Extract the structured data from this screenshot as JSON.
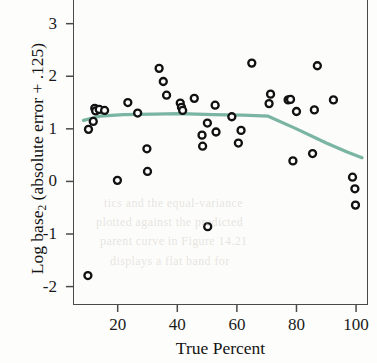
{
  "chart_data": {
    "type": "scatter",
    "title": "",
    "xlabel": "True Percent",
    "ylabel": "Log base_2 (absolute error + .125)",
    "ylabel_main": "Log base",
    "ylabel_sub": "2",
    "ylabel_tail": " (absolute error + .125)",
    "xlim": [
      5,
      104
    ],
    "ylim": [
      -2.35,
      3.45
    ],
    "xticks": [
      20,
      40,
      60,
      80,
      100
    ],
    "yticks": [
      3,
      2,
      1,
      0,
      -1,
      -2
    ],
    "xtick_labels": [
      "20",
      "40",
      "60",
      "80",
      "100"
    ],
    "ytick_labels": [
      "3",
      "2",
      "1",
      "0",
      "-1",
      "-2"
    ],
    "grid": false,
    "legend": false,
    "marker": "open-circle",
    "marker_color": "#111111",
    "marker_face": "#ffffff",
    "points": [
      {
        "x": 10.0,
        "y": -1.79
      },
      {
        "x": 10.2,
        "y": 0.99
      },
      {
        "x": 11.8,
        "y": 1.14
      },
      {
        "x": 12.3,
        "y": 1.39
      },
      {
        "x": 12.6,
        "y": 1.34
      },
      {
        "x": 13.8,
        "y": 1.37
      },
      {
        "x": 15.6,
        "y": 1.35
      },
      {
        "x": 19.9,
        "y": 0.02
      },
      {
        "x": 23.4,
        "y": 1.5
      },
      {
        "x": 26.7,
        "y": 1.3
      },
      {
        "x": 29.8,
        "y": 0.62
      },
      {
        "x": 30.0,
        "y": 0.19
      },
      {
        "x": 33.9,
        "y": 2.15
      },
      {
        "x": 35.3,
        "y": 1.9
      },
      {
        "x": 36.4,
        "y": 1.64
      },
      {
        "x": 41.0,
        "y": 1.49
      },
      {
        "x": 41.4,
        "y": 1.41
      },
      {
        "x": 41.8,
        "y": 1.35
      },
      {
        "x": 45.7,
        "y": 1.58
      },
      {
        "x": 48.3,
        "y": 0.88
      },
      {
        "x": 48.5,
        "y": 0.67
      },
      {
        "x": 50.1,
        "y": 1.11
      },
      {
        "x": 50.2,
        "y": -0.86
      },
      {
        "x": 52.7,
        "y": 1.45
      },
      {
        "x": 53.0,
        "y": 0.94
      },
      {
        "x": 58.3,
        "y": 1.23
      },
      {
        "x": 60.5,
        "y": 0.73
      },
      {
        "x": 61.4,
        "y": 0.97
      },
      {
        "x": 65.0,
        "y": 2.25
      },
      {
        "x": 70.8,
        "y": 1.48
      },
      {
        "x": 71.3,
        "y": 1.66
      },
      {
        "x": 77.2,
        "y": 1.55
      },
      {
        "x": 78.0,
        "y": 1.56
      },
      {
        "x": 78.8,
        "y": 0.39
      },
      {
        "x": 80.0,
        "y": 1.33
      },
      {
        "x": 85.4,
        "y": 0.53
      },
      {
        "x": 86.0,
        "y": 1.36
      },
      {
        "x": 87.0,
        "y": 2.2
      },
      {
        "x": 92.4,
        "y": 1.55
      },
      {
        "x": 98.8,
        "y": 0.08
      },
      {
        "x": 99.6,
        "y": -0.14
      },
      {
        "x": 99.8,
        "y": -0.45
      }
    ],
    "trend_line": {
      "name": "lowess-smoother",
      "color": "#79b5a2",
      "width": 3.2,
      "points": [
        {
          "x": 8.5,
          "y": 1.16
        },
        {
          "x": 14.0,
          "y": 1.24
        },
        {
          "x": 22.0,
          "y": 1.27
        },
        {
          "x": 32.0,
          "y": 1.28
        },
        {
          "x": 41.0,
          "y": 1.29
        },
        {
          "x": 52.0,
          "y": 1.27
        },
        {
          "x": 62.0,
          "y": 1.26
        },
        {
          "x": 70.5,
          "y": 1.24
        },
        {
          "x": 80.0,
          "y": 1.0
        },
        {
          "x": 90.0,
          "y": 0.73
        },
        {
          "x": 97.0,
          "y": 0.56
        },
        {
          "x": 102.0,
          "y": 0.45
        }
      ]
    }
  },
  "background_bleed": [
    {
      "text": "tics and the equal-variance",
      "x": 104,
      "y": 196
    },
    {
      "text": "plotted against the predicted",
      "x": 96,
      "y": 215
    },
    {
      "text": "parent curve in Figure 14.21",
      "x": 100,
      "y": 234
    },
    {
      "text": "displays a flat band for",
      "x": 110,
      "y": 254
    }
  ]
}
